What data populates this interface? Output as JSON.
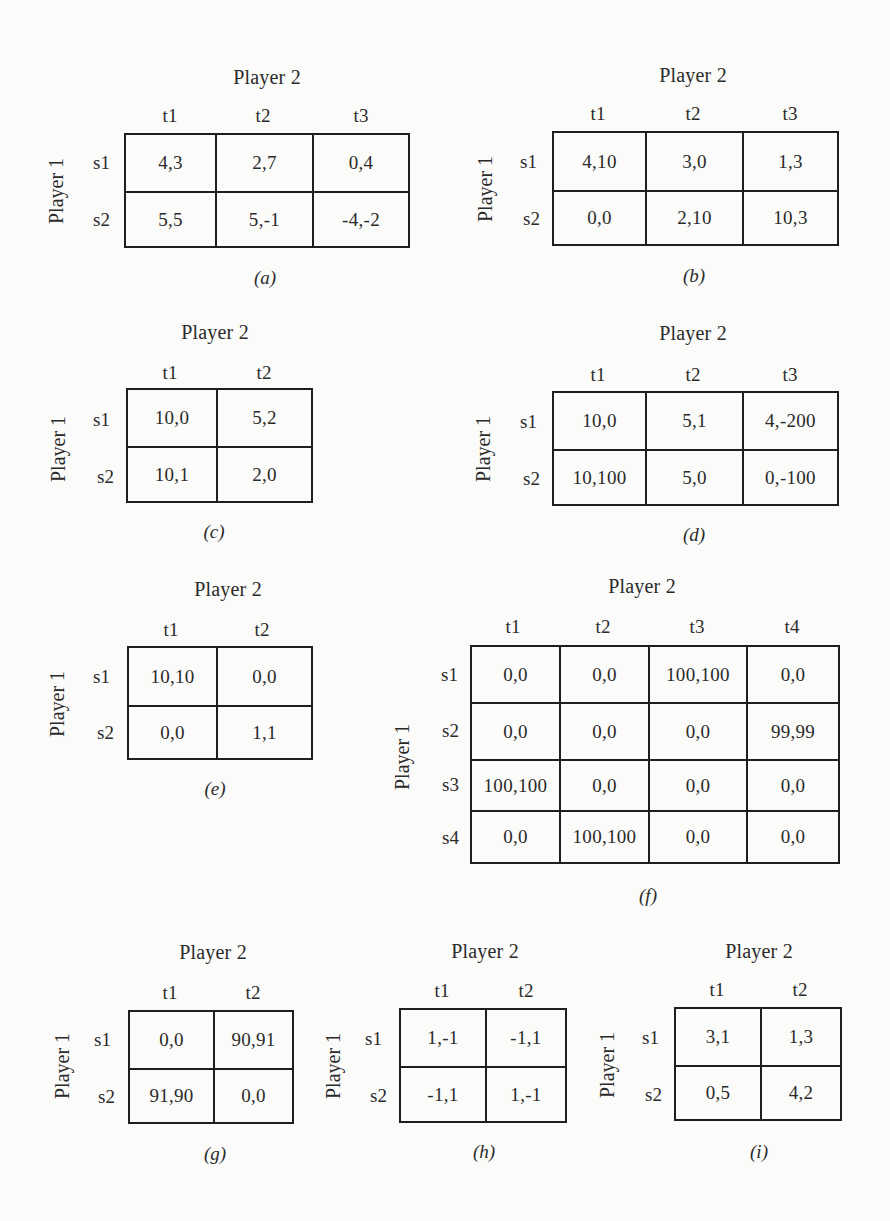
{
  "figures": [
    {
      "id": "a",
      "caption": "(a)",
      "column_player": "Player 2",
      "row_player": "Player 1",
      "columns": [
        "t1",
        "t2",
        "t3"
      ],
      "rows": [
        "s1",
        "s2"
      ],
      "payoffs": [
        [
          "4,3",
          "2,7",
          "0,4"
        ],
        [
          "5,5",
          "5,-1",
          "-4,-2"
        ]
      ]
    },
    {
      "id": "b",
      "caption": "(b)",
      "column_player": "Player 2",
      "row_player": "Player 1",
      "columns": [
        "t1",
        "t2",
        "t3"
      ],
      "rows": [
        "s1",
        "s2"
      ],
      "payoffs": [
        [
          "4,10",
          "3,0",
          "1,3"
        ],
        [
          "0,0",
          "2,10",
          "10,3"
        ]
      ]
    },
    {
      "id": "c",
      "caption": "(c)",
      "column_player": "Player 2",
      "row_player": "Player 1",
      "columns": [
        "t1",
        "t2"
      ],
      "rows": [
        "s1",
        "s2"
      ],
      "payoffs": [
        [
          "10,0",
          "5,2"
        ],
        [
          "10,1",
          "2,0"
        ]
      ]
    },
    {
      "id": "d",
      "caption": "(d)",
      "column_player": "Player 2",
      "row_player": "Player 1",
      "columns": [
        "t1",
        "t2",
        "t3"
      ],
      "rows": [
        "s1",
        "s2"
      ],
      "payoffs": [
        [
          "10,0",
          "5,1",
          "4,-200"
        ],
        [
          "10,100",
          "5,0",
          "0,-100"
        ]
      ]
    },
    {
      "id": "e",
      "caption": "(e)",
      "column_player": "Player 2",
      "row_player": "Player 1",
      "columns": [
        "t1",
        "t2"
      ],
      "rows": [
        "s1",
        "s2"
      ],
      "payoffs": [
        [
          "10,10",
          "0,0"
        ],
        [
          "0,0",
          "1,1"
        ]
      ]
    },
    {
      "id": "f",
      "caption": "(f)",
      "column_player": "Player 2",
      "row_player": "Player 1",
      "columns": [
        "t1",
        "t2",
        "t3",
        "t4"
      ],
      "rows": [
        "s1",
        "s2",
        "s3",
        "s4"
      ],
      "payoffs": [
        [
          "0,0",
          "0,0",
          "100,100",
          "0,0"
        ],
        [
          "0,0",
          "0,0",
          "0,0",
          "99,99"
        ],
        [
          "100,100",
          "0,0",
          "0,0",
          "0,0"
        ],
        [
          "0,0",
          "100,100",
          "0,0",
          "0,0"
        ]
      ]
    },
    {
      "id": "g",
      "caption": "(g)",
      "column_player": "Player 2",
      "row_player": "Player 1",
      "columns": [
        "t1",
        "t2"
      ],
      "rows": [
        "s1",
        "s2"
      ],
      "payoffs": [
        [
          "0,0",
          "90,91"
        ],
        [
          "91,90",
          "0,0"
        ]
      ]
    },
    {
      "id": "h",
      "caption": "(h)",
      "column_player": "Player 2",
      "row_player": "Player 1",
      "columns": [
        "t1",
        "t2"
      ],
      "rows": [
        "s1",
        "s2"
      ],
      "payoffs": [
        [
          "1,-1",
          "-1,1"
        ],
        [
          "-1,1",
          "1,-1"
        ]
      ]
    },
    {
      "id": "i",
      "caption": "(i)",
      "column_player": "Player 2",
      "row_player": "Player 1",
      "columns": [
        "t1",
        "t2"
      ],
      "rows": [
        "s1",
        "s2"
      ],
      "payoffs": [
        [
          "3,1",
          "1,3"
        ],
        [
          "0,5",
          "4,2"
        ]
      ]
    }
  ]
}
